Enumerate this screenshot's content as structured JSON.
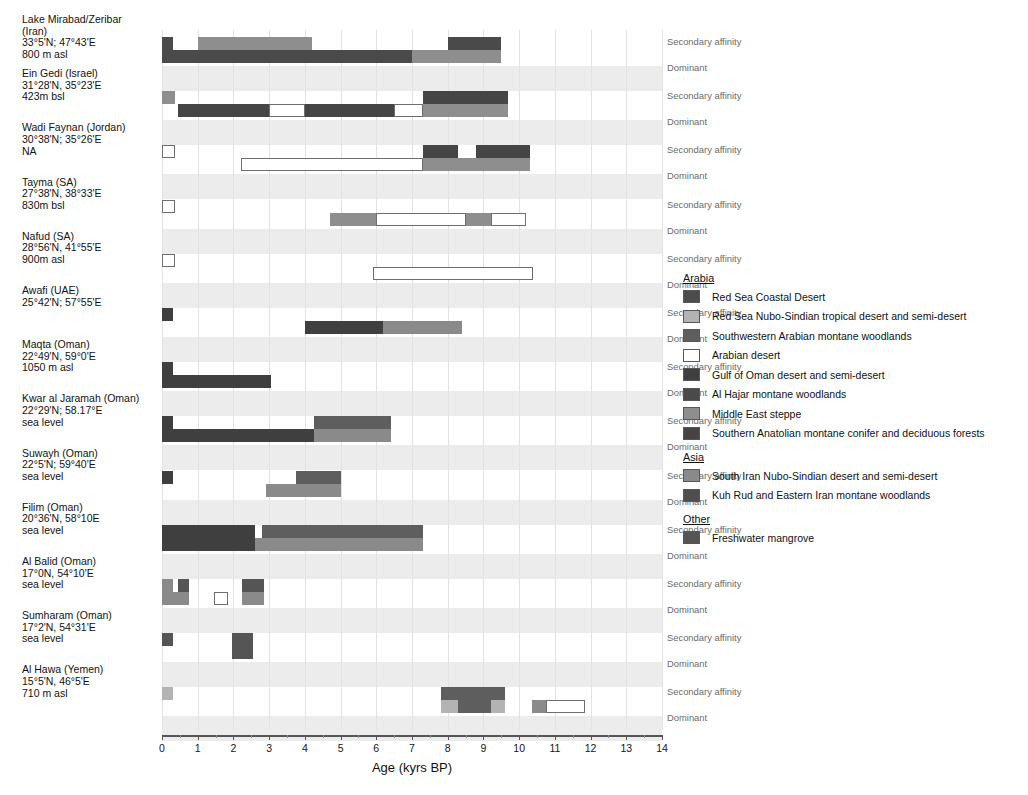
{
  "chart_data": {
    "type": "bar",
    "title": "",
    "xlabel": "Age (kyrs BP)",
    "ylabel": "",
    "xlim": [
      0,
      14
    ],
    "xticks": [
      0,
      1,
      2,
      3,
      4,
      5,
      6,
      7,
      8,
      9,
      10,
      11,
      12,
      13,
      14
    ],
    "xticklabels": [
      "0",
      "1",
      "2",
      "3",
      "4",
      "5",
      "6",
      "7",
      "8",
      "9",
      "10",
      "11",
      "12",
      "13",
      "14"
    ],
    "grid": true,
    "legend_position": "right",
    "row_track_labels": [
      "Secondary affinity",
      "Dominant"
    ],
    "legend": {
      "groups": [
        {
          "name": "Arabia",
          "entries": [
            {
              "label": "Red Sea Coastal Desert",
              "color": "#4c4c4c"
            },
            {
              "label": "Red Sea Nubo-Sindian tropical desert and semi-desert",
              "color": "#b3b3b3"
            },
            {
              "label": "Southwestern Arabian montane woodlands",
              "color": "#5e5e5e"
            },
            {
              "label": "Arabian desert",
              "color": "#ffffff"
            },
            {
              "label": "Gulf of Oman desert and semi-desert",
              "color": "#3f3f3f"
            },
            {
              "label": "Al Hajar montane woodlands",
              "color": "#4a4a4a"
            },
            {
              "label": "Middle East steppe",
              "color": "#8e8e8e"
            },
            {
              "label": "Southern Anatolian montane conifer and deciduous forests",
              "color": "#454545"
            }
          ]
        },
        {
          "name": "Asia",
          "entries": [
            {
              "label": "South Iran Nubo-Sindian desert and semi-desert",
              "color": "#8a8a8a"
            },
            {
              "label": "Kuh Rud and Eastern Iran montane woodlands",
              "color": "#4e4e4e"
            }
          ]
        },
        {
          "name": "Other",
          "entries": [
            {
              "label": "Freshwater mangrove",
              "color": "#555555"
            }
          ]
        }
      ]
    },
    "sites": [
      {
        "name": "Lake Mirabad/Zeribar",
        "region": "(Iran)",
        "coords": "33°5'N; 47°43'E",
        "elevation": "800 m asl",
        "label": "Lake Mirabad/Zeribar\n(Iran)\n33°5'N; 47°43'E\n800 m asl",
        "secondary": [
          {
            "start": 0.0,
            "end": 0.3,
            "color": "#4a4a4a"
          },
          {
            "start": 1.0,
            "end": 4.2,
            "color": "#8e8e8e"
          },
          {
            "start": 8.0,
            "end": 9.5,
            "color": "#4a4a4a"
          }
        ],
        "dominant": [
          {
            "start": 0.0,
            "end": 7.0,
            "color": "#4a4a4a"
          },
          {
            "start": 7.0,
            "end": 9.5,
            "color": "#8e8e8e"
          }
        ]
      },
      {
        "name": "Ein Gedi (Israel)",
        "coords": "31°28'N, 35°23'E",
        "elevation": "423m bsl",
        "label": "Ein Gedi (Israel)\n31°28'N, 35°23'E\n423m bsl",
        "secondary": [
          {
            "start": 0.0,
            "end": 0.35,
            "color": "#8e8e8e"
          },
          {
            "start": 7.3,
            "end": 9.7,
            "color": "#454545"
          }
        ],
        "dominant": [
          {
            "start": 0.45,
            "end": 3.0,
            "color": "#454545"
          },
          {
            "start": 3.0,
            "end": 4.0,
            "color": "#ffffff"
          },
          {
            "start": 4.0,
            "end": 6.5,
            "color": "#454545"
          },
          {
            "start": 6.5,
            "end": 7.3,
            "color": "#ffffff"
          },
          {
            "start": 7.3,
            "end": 9.7,
            "color": "#8e8e8e"
          }
        ]
      },
      {
        "name": "Wadi Faynan (Jordan)",
        "coords": "30°38'N; 35°26'E",
        "elevation": "NA",
        "label": "Wadi Faynan (Jordan)\n30°38'N; 35°26'E\nNA",
        "secondary": [
          {
            "start": 0.0,
            "end": 0.35,
            "color": "#ffffff"
          },
          {
            "start": 7.3,
            "end": 8.3,
            "color": "#454545"
          },
          {
            "start": 8.8,
            "end": 10.3,
            "color": "#454545"
          }
        ],
        "dominant": [
          {
            "start": 2.2,
            "end": 7.3,
            "color": "#ffffff"
          },
          {
            "start": 7.3,
            "end": 10.3,
            "color": "#8e8e8e"
          }
        ]
      },
      {
        "name": "Tayma (SA)",
        "coords": "27°38'N, 38°33'E",
        "elevation": "830m bsl",
        "label": "Tayma (SA)\n27°38'N, 38°33'E\n830m bsl",
        "secondary": [
          {
            "start": 0.0,
            "end": 0.35,
            "color": "#ffffff"
          }
        ],
        "dominant": [
          {
            "start": 4.7,
            "end": 6.0,
            "color": "#8e8e8e"
          },
          {
            "start": 6.0,
            "end": 8.5,
            "color": "#ffffff"
          },
          {
            "start": 8.5,
            "end": 9.2,
            "color": "#8e8e8e"
          },
          {
            "start": 9.2,
            "end": 10.2,
            "color": "#ffffff"
          }
        ]
      },
      {
        "name": "Nafud (SA)",
        "coords": "28°56'N, 41°55'E",
        "elevation": "900m asl",
        "label": "Nafud (SA)\n28°56'N, 41°55'E\n900m asl",
        "secondary": [
          {
            "start": 0.0,
            "end": 0.35,
            "color": "#ffffff"
          }
        ],
        "dominant": [
          {
            "start": 5.9,
            "end": 10.4,
            "color": "#ffffff"
          }
        ]
      },
      {
        "name": "Awafi (UAE)",
        "coords": "25°42'N; 57°55'E",
        "elevation": "",
        "label": "Awafi (UAE)\n25°42'N; 57°55'E",
        "secondary": [
          {
            "start": 0.0,
            "end": 0.3,
            "color": "#3f3f3f"
          }
        ],
        "dominant": [
          {
            "start": 4.0,
            "end": 6.2,
            "color": "#3f3f3f"
          },
          {
            "start": 6.2,
            "end": 8.4,
            "color": "#8a8a8a"
          }
        ]
      },
      {
        "name": "Maqta (Oman)",
        "coords": "22°49'N, 59°0'E",
        "elevation": "1050 m asl",
        "label": "Maqta (Oman)\n22°49'N, 59°0'E\n1050 m asl",
        "secondary": [
          {
            "start": 0.0,
            "end": 0.3,
            "color": "#3f3f3f"
          }
        ],
        "dominant": [
          {
            "start": 0.0,
            "end": 3.05,
            "color": "#3f3f3f"
          }
        ]
      },
      {
        "name": "Kwar al Jaramah (Oman)",
        "coords": "22°29'N; 58.17°E",
        "elevation": "sea level",
        "label": "Kwar al Jaramah (Oman)\n22°29'N; 58.17°E\nsea level",
        "secondary": [
          {
            "start": 0.0,
            "end": 0.3,
            "color": "#3f3f3f"
          },
          {
            "start": 4.25,
            "end": 6.4,
            "color": "#5e5e5e"
          }
        ],
        "dominant": [
          {
            "start": 0.0,
            "end": 4.25,
            "color": "#3f3f3f"
          },
          {
            "start": 4.25,
            "end": 6.4,
            "color": "#8a8a8a"
          }
        ]
      },
      {
        "name": "Suwayh (Oman)",
        "coords": "22°5'N; 59°40'E",
        "elevation": "sea level",
        "label": "Suwayh (Oman)\n22°5'N; 59°40'E\nsea level",
        "secondary": [
          {
            "start": 0.0,
            "end": 0.3,
            "color": "#3f3f3f"
          },
          {
            "start": 3.75,
            "end": 5.0,
            "color": "#5e5e5e"
          }
        ],
        "dominant": [
          {
            "start": 2.9,
            "end": 5.0,
            "color": "#8a8a8a"
          }
        ]
      },
      {
        "name": "Filim (Oman)",
        "coords": "20°36'N, 58°10E",
        "elevation": "sea level",
        "label": "Filim (Oman)\n20°36'N, 58°10E\nsea level",
        "secondary": [
          {
            "start": 0.0,
            "end": 2.6,
            "color": "#3f3f3f"
          },
          {
            "start": 2.8,
            "end": 7.3,
            "color": "#5e5e5e"
          }
        ],
        "dominant": [
          {
            "start": 0.0,
            "end": 2.6,
            "color": "#3f3f3f"
          },
          {
            "start": 2.6,
            "end": 7.3,
            "color": "#8a8a8a"
          }
        ]
      },
      {
        "name": "Al Balid (Oman)",
        "coords": "17°0N, 54°10'E",
        "elevation": "sea level",
        "label": "Al Balid (Oman)\n17°0N, 54°10'E\nsea level",
        "secondary": [
          {
            "start": 0.0,
            "end": 0.3,
            "color": "#8a8a8a"
          },
          {
            "start": 0.45,
            "end": 0.75,
            "color": "#555555"
          },
          {
            "start": 2.25,
            "end": 2.85,
            "color": "#555555"
          }
        ],
        "dominant": [
          {
            "start": 0.0,
            "end": 0.75,
            "color": "#8a8a8a"
          },
          {
            "start": 1.45,
            "end": 1.85,
            "color": "#ffffff"
          },
          {
            "start": 2.25,
            "end": 2.85,
            "color": "#8a8a8a"
          }
        ]
      },
      {
        "name": "Sumharam (Oman)",
        "coords": "17°2'N, 54°31'E",
        "elevation": "sea level",
        "label": "Sumharam (Oman)\n17°2'N, 54°31'E\nsea level",
        "secondary": [
          {
            "start": 0.0,
            "end": 0.3,
            "color": "#555555"
          },
          {
            "start": 1.95,
            "end": 2.55,
            "color": "#555555"
          }
        ],
        "dominant": [
          {
            "start": 1.95,
            "end": 2.55,
            "color": "#555555"
          }
        ]
      },
      {
        "name": "Al Hawa (Yemen)",
        "coords": "15°5'N, 46°5'E",
        "elevation": "710 m asl",
        "label": "Al Hawa (Yemen)\n15°5'N, 46°5'E\n710 m asl",
        "secondary": [
          {
            "start": 0.0,
            "end": 0.3,
            "color": "#b3b3b3"
          },
          {
            "start": 7.8,
            "end": 9.6,
            "color": "#5e5e5e"
          }
        ],
        "dominant": [
          {
            "start": 7.8,
            "end": 8.3,
            "color": "#b3b3b3"
          },
          {
            "start": 8.3,
            "end": 9.2,
            "color": "#5e5e5e"
          },
          {
            "start": 9.2,
            "end": 9.6,
            "color": "#b3b3b3"
          },
          {
            "start": 10.35,
            "end": 10.75,
            "color": "#8a8a8a"
          },
          {
            "start": 10.75,
            "end": 11.85,
            "color": "#ffffff"
          }
        ]
      }
    ]
  }
}
